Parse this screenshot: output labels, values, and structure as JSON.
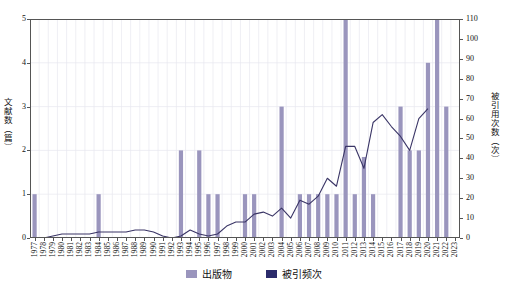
{
  "chart_data": {
    "type": "bar",
    "title": "",
    "xlabel": "",
    "ylabel": "文献数（篇）",
    "ylabel_right": "被引用次数（次）",
    "ylim": [
      0,
      5
    ],
    "ylim_right": [
      0,
      110
    ],
    "yticks": [
      0,
      1,
      2,
      3,
      4,
      5
    ],
    "yticks_right": [
      0,
      10,
      20,
      30,
      40,
      50,
      60,
      70,
      80,
      90,
      100,
      110
    ],
    "grid": true,
    "legend_position": "bottom",
    "categories": [
      "1977",
      "1978",
      "1979",
      "1980",
      "1981",
      "1982",
      "1983",
      "1984",
      "1985",
      "1986",
      "1987",
      "1988",
      "1989",
      "1990",
      "1991",
      "1992",
      "1993",
      "1994",
      "1995",
      "1996",
      "1997",
      "1998",
      "1999",
      "2000",
      "2001",
      "2002",
      "2003",
      "2004",
      "2005",
      "2006",
      "2007",
      "2008",
      "2009",
      "2010",
      "2011",
      "2012",
      "2013",
      "2014",
      "2015",
      "2016",
      "2017",
      "2018",
      "2019",
      "2020",
      "2021",
      "2022",
      "2023"
    ],
    "series": [
      {
        "name": "出版物",
        "type": "bar",
        "axis": "left",
        "color": "#9a95bd",
        "values": [
          1,
          0,
          0,
          0,
          0,
          0,
          0,
          1,
          0,
          0,
          0,
          0,
          0,
          0,
          0,
          0,
          2,
          0,
          2,
          1,
          1,
          0,
          0,
          1,
          1,
          0,
          0,
          3,
          0,
          1,
          1,
          1,
          1,
          1,
          5,
          1,
          1.85,
          1,
          0,
          0,
          3,
          2,
          2,
          4,
          5,
          3,
          0
        ]
      },
      {
        "name": "被引频次",
        "type": "line",
        "axis": "right",
        "color": "#3a3566",
        "values": [
          0,
          0,
          1,
          2,
          2,
          2,
          2,
          3,
          3,
          3,
          3,
          4,
          4,
          3,
          1,
          0,
          1,
          4,
          2,
          1,
          2,
          6,
          8,
          8,
          12,
          13,
          11,
          15,
          10,
          19,
          17,
          21,
          30,
          26,
          46,
          46,
          35,
          58,
          62,
          56,
          51,
          44,
          60,
          65,
          null,
          null,
          null
        ]
      }
    ]
  },
  "legend": {
    "items": [
      {
        "label": "出版物",
        "color": "#9a95bd"
      },
      {
        "label": "被引频次",
        "color": "#2b2b6b"
      }
    ]
  }
}
